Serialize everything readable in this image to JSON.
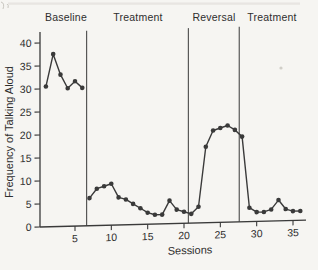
{
  "figure": {
    "kind": "scanned textbook figure",
    "background_color": "#f6f5f2",
    "ink_color": "#3a3a3a",
    "divider_color": "#4a4a4a"
  },
  "chart_data": {
    "type": "line",
    "title": "",
    "xlabel": "Sessions",
    "ylabel": "Frequency of Talking Aloud",
    "x_ticks": [
      5,
      10,
      15,
      20,
      25,
      30,
      35
    ],
    "y_ticks": [
      0,
      5,
      10,
      15,
      20,
      25,
      30,
      35,
      40
    ],
    "xlim": [
      0.5,
      36.8
    ],
    "ylim": [
      0,
      40
    ],
    "grid": false,
    "legend": "none",
    "marker": "filled-circle",
    "phases": [
      {
        "label": "Baseline",
        "session_start": 1,
        "session_end": 6
      },
      {
        "label": "Treatment",
        "session_start": 7,
        "session_end": 20
      },
      {
        "label": "Reversal",
        "session_start": 21,
        "session_end": 27
      },
      {
        "label": "Treatment",
        "session_start": 28,
        "session_end": 36
      }
    ],
    "phase_divider_sessions": [
      6.6,
      20.6,
      27.6
    ],
    "series": [
      {
        "name": "Frequency of talking aloud",
        "sessions": [
          1,
          2,
          3,
          4,
          5,
          6,
          7,
          8,
          9,
          10,
          11,
          12,
          13,
          14,
          15,
          16,
          17,
          18,
          19,
          20,
          21,
          22,
          23,
          24,
          25,
          26,
          27,
          28,
          29,
          30,
          31,
          32,
          33,
          34,
          35,
          36
        ],
        "values": [
          30.5,
          37.5,
          33,
          30,
          31.5,
          30,
          6,
          8,
          8.5,
          9,
          6,
          5.5,
          4.5,
          3.5,
          2.5,
          2,
          2,
          5,
          3,
          2.5,
          2,
          3.5,
          16.5,
          20,
          20.5,
          21,
          20,
          18.5,
          3,
          2,
          2,
          2.5,
          4.5,
          2.5,
          2,
          2
        ],
        "line_break_after_session": 6
      }
    ]
  }
}
